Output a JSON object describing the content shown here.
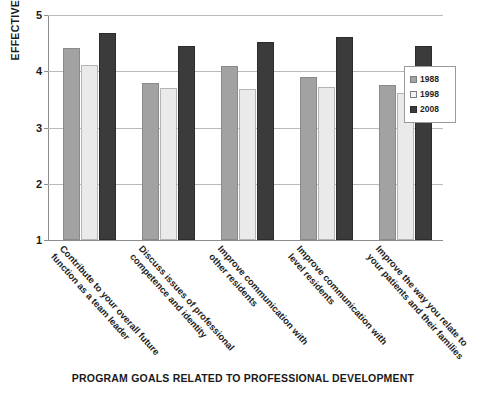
{
  "chart_data": {
    "type": "bar",
    "title": "",
    "xlabel": "PROGRAM GOALS RELATED TO PROFESSIONAL DEVELOPMENT",
    "ylabel": "EFFECTIVENESS RATING",
    "ylim": [
      1,
      5
    ],
    "yticks": [
      1,
      2,
      3,
      4,
      5
    ],
    "ytick_labels": [
      "1",
      "2",
      "3",
      "4",
      "5"
    ],
    "grid": true,
    "legend_position": "right",
    "categories": [
      "Contribute to your overall future function as a team leader",
      "Discuss issues of professional competence and identity",
      "Improve communication with other residents",
      "Improve communication with level residents",
      "Improve the way you relate to your patients and their families"
    ],
    "series": [
      {
        "name": "1988",
        "color": "#a2a2a2",
        "values": [
          4.42,
          3.8,
          4.1,
          3.89,
          3.76
        ]
      },
      {
        "name": "1998",
        "color": "#eaeaea",
        "values": [
          4.12,
          3.7,
          3.68,
          3.72,
          3.62
        ]
      },
      {
        "name": "2008",
        "color": "#3b3b3b",
        "values": [
          4.68,
          4.45,
          4.52,
          4.61,
          4.45
        ]
      }
    ]
  },
  "legend": {
    "items": [
      {
        "label": "1988"
      },
      {
        "label": "1998"
      },
      {
        "label": "2008"
      }
    ]
  }
}
